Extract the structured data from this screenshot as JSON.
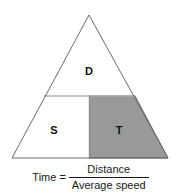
{
  "figure": {
    "top_artifact_text": "",
    "regions": [
      {
        "key": "distance",
        "label": "D",
        "fill": "#ffffff",
        "position": "top"
      },
      {
        "key": "speed",
        "label": "S",
        "fill": "#ffffff",
        "position": "bottom-left"
      },
      {
        "key": "time",
        "label": "T",
        "fill": "#999999",
        "position": "bottom-right"
      }
    ],
    "formula": {
      "lhs": "Time",
      "equals": "=",
      "numerator": "Distance",
      "denominator": "Average speed"
    },
    "colors": {
      "outline": "#6b6b6b",
      "divider": "#b0b0b0",
      "shaded_fill": "#999999",
      "shaded_outline": "#6b6b6b",
      "text": "#1a1a1a",
      "background": "#ffffff"
    },
    "geometry": {
      "apex": [
        89,
        15
      ],
      "base_left": [
        12,
        158
      ],
      "base_right": [
        168,
        158
      ],
      "horizontal_divider_y": 96,
      "vertical_divider_x": 89.5
    }
  }
}
